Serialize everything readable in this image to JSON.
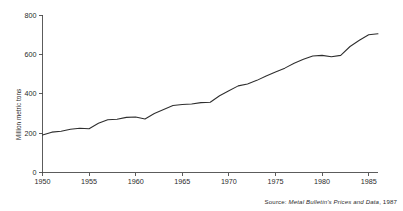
{
  "chart_data": {
    "type": "line",
    "title": "",
    "subtitle": "",
    "xlabel": "",
    "ylabel": "Million metric tons",
    "xlim": [
      1950,
      1986
    ],
    "ylim": [
      0,
      800
    ],
    "grid": false,
    "legend": null,
    "legend_position": "none",
    "line_color": "#2e2e2e",
    "background_color": "#ffffff",
    "y_ticks": [
      0,
      200,
      400,
      600,
      800
    ],
    "y_tick_labels": [
      "0",
      "200",
      "400",
      "600",
      "800"
    ],
    "x_ticks": [
      1950,
      1955,
      1960,
      1965,
      1970,
      1975,
      1980,
      1985
    ],
    "x_tick_labels": [
      "1950",
      "1955",
      "1960",
      "1965",
      "1970",
      "1975",
      "1980",
      "1985"
    ],
    "x": [
      1950,
      1951,
      1952,
      1953,
      1954,
      1955,
      1956,
      1957,
      1958,
      1959,
      1960,
      1961,
      1962,
      1963,
      1964,
      1965,
      1966,
      1967,
      1968,
      1969,
      1970,
      1971,
      1972,
      1973,
      1974,
      1975,
      1976,
      1977,
      1978,
      1979,
      1980,
      1981,
      1982,
      1983,
      1984,
      1985,
      1986
    ],
    "values": [
      190,
      205,
      210,
      220,
      225,
      222,
      250,
      268,
      270,
      280,
      282,
      272,
      300,
      320,
      340,
      345,
      348,
      355,
      357,
      390,
      415,
      440,
      450,
      468,
      490,
      510,
      530,
      555,
      575,
      592,
      595,
      588,
      595,
      640,
      672,
      700,
      705
    ],
    "values_note": "Million metric tons, read from axis gridlines",
    "annotations": [],
    "source": "Source: Metal Bulletin's Prices and Data, 1987"
  },
  "axis": {
    "y_title": "Million metric tons"
  },
  "source": {
    "prefix": "Source:",
    "title": "Metal Bulletin's Prices and Data",
    "suffix": ", 1987"
  }
}
